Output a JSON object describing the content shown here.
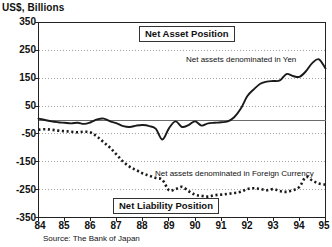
{
  "axis": {
    "y_title": "US$, Billions",
    "y_ticks": [
      "350",
      "250",
      "150",
      "50",
      "-50",
      "-150",
      "-250",
      "-350"
    ],
    "x_ticks": [
      "84",
      "85",
      "86",
      "87",
      "88",
      "89",
      "90",
      "91",
      "92",
      "93",
      "94",
      "95"
    ]
  },
  "labels": {
    "net_asset_position": "Net Asset Position",
    "net_liability_position": "Net Liability Position",
    "note_yen": "Net assets denominated in Yen",
    "note_foreign": "Net assets denominated in Foreign Currency",
    "source": "Source: The Bank of Japan"
  },
  "colors": {
    "line": "#1a1a1a",
    "grid": "#9a9a9a",
    "frame": "#222222",
    "background": "#ffffff"
  },
  "chart_data": {
    "type": "line",
    "title": "",
    "subtitle": "",
    "xlabel": "",
    "ylabel": "US$, Billions",
    "xlim": [
      1984.0,
      1995.0
    ],
    "ylim": [
      -350,
      350
    ],
    "yticks": [
      -350,
      -250,
      -150,
      -50,
      50,
      150,
      250,
      350
    ],
    "xticks": [
      1984,
      1985,
      1986,
      1987,
      1988,
      1989,
      1990,
      1991,
      1992,
      1993,
      1994,
      1995
    ],
    "grid": true,
    "legend_position": "inline-annotations",
    "annotations": [
      {
        "text": "Net Asset Position",
        "x": 1988.2,
        "y": 300,
        "boxed": true
      },
      {
        "text": "Net Liability Position",
        "x": 1987.3,
        "y": -300,
        "boxed": true
      },
      {
        "text": "Net assets denominated in Yen",
        "x": 1990.0,
        "y": 215,
        "boxed": false
      },
      {
        "text": "Net assets denominated in Foreign Currency",
        "x": 1988.6,
        "y": -185,
        "boxed": false
      }
    ],
    "series": [
      {
        "name": "Net assets denominated in Yen",
        "style": "solid",
        "x": [
          1984.0,
          1984.25,
          1984.5,
          1984.75,
          1985.0,
          1985.25,
          1985.5,
          1985.75,
          1986.0,
          1986.25,
          1986.5,
          1986.75,
          1987.0,
          1987.25,
          1987.5,
          1987.75,
          1988.0,
          1988.25,
          1988.5,
          1988.75,
          1989.0,
          1989.25,
          1989.5,
          1989.75,
          1990.0,
          1990.25,
          1990.5,
          1990.75,
          1991.0,
          1991.25,
          1991.5,
          1991.75,
          1992.0,
          1992.25,
          1992.5,
          1992.75,
          1993.0,
          1993.25,
          1993.5,
          1993.75,
          1994.0,
          1994.25,
          1994.5,
          1994.75,
          1995.0
        ],
        "values": [
          5,
          0,
          -5,
          -8,
          -10,
          -12,
          -10,
          -14,
          -8,
          2,
          5,
          -5,
          -12,
          -22,
          -25,
          -20,
          -18,
          -22,
          -32,
          -70,
          -30,
          -5,
          -25,
          -18,
          -5,
          -20,
          -12,
          -10,
          -8,
          -5,
          10,
          40,
          85,
          110,
          130,
          138,
          140,
          142,
          165,
          158,
          155,
          175,
          205,
          218,
          185
        ]
      },
      {
        "name": "Net assets denominated in Foreign Currency",
        "style": "dotted",
        "x": [
          1984.0,
          1984.25,
          1984.5,
          1984.75,
          1985.0,
          1985.25,
          1985.5,
          1985.75,
          1986.0,
          1986.25,
          1986.5,
          1986.75,
          1987.0,
          1987.25,
          1987.5,
          1987.75,
          1988.0,
          1988.25,
          1988.5,
          1988.75,
          1989.0,
          1989.25,
          1989.5,
          1989.75,
          1990.0,
          1990.25,
          1990.5,
          1990.75,
          1991.0,
          1991.25,
          1991.5,
          1991.75,
          1992.0,
          1992.25,
          1992.5,
          1992.75,
          1993.0,
          1993.25,
          1993.5,
          1993.75,
          1994.0,
          1994.25,
          1994.5,
          1994.75,
          1995.0
        ],
        "values": [
          -35,
          -33,
          -35,
          -38,
          -40,
          -42,
          -44,
          -42,
          -45,
          -60,
          -80,
          -100,
          -125,
          -150,
          -168,
          -180,
          -192,
          -200,
          -208,
          -215,
          -252,
          -248,
          -240,
          -255,
          -268,
          -272,
          -275,
          -270,
          -268,
          -265,
          -262,
          -258,
          -248,
          -245,
          -248,
          -252,
          -248,
          -255,
          -258,
          -252,
          -240,
          -205,
          -218,
          -228,
          -232
        ]
      }
    ]
  }
}
